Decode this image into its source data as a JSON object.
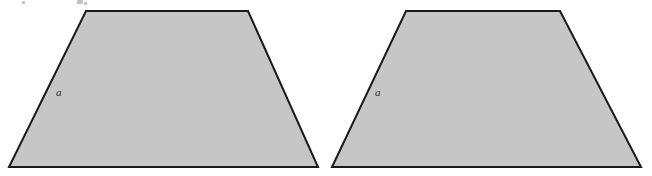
{
  "figure": {
    "background_color": "#ffffff",
    "shape_fill_color": "#c6c6c6",
    "shape_stroke_color": "#1a1a1a",
    "shape_stroke_width": 2,
    "label_color": "#2b2b2b",
    "shapes": [
      {
        "name": "left-trapezoid",
        "type": "trapezoid",
        "points": "86,11 248,11 318,167 9,167",
        "label": "a",
        "label_x": 56,
        "label_y": 96
      },
      {
        "name": "right-trapezoid",
        "type": "trapezoid",
        "points": "406,11 560,11 641,167 332,167",
        "label": "a",
        "label_x": 375,
        "label_y": 96
      }
    ]
  }
}
